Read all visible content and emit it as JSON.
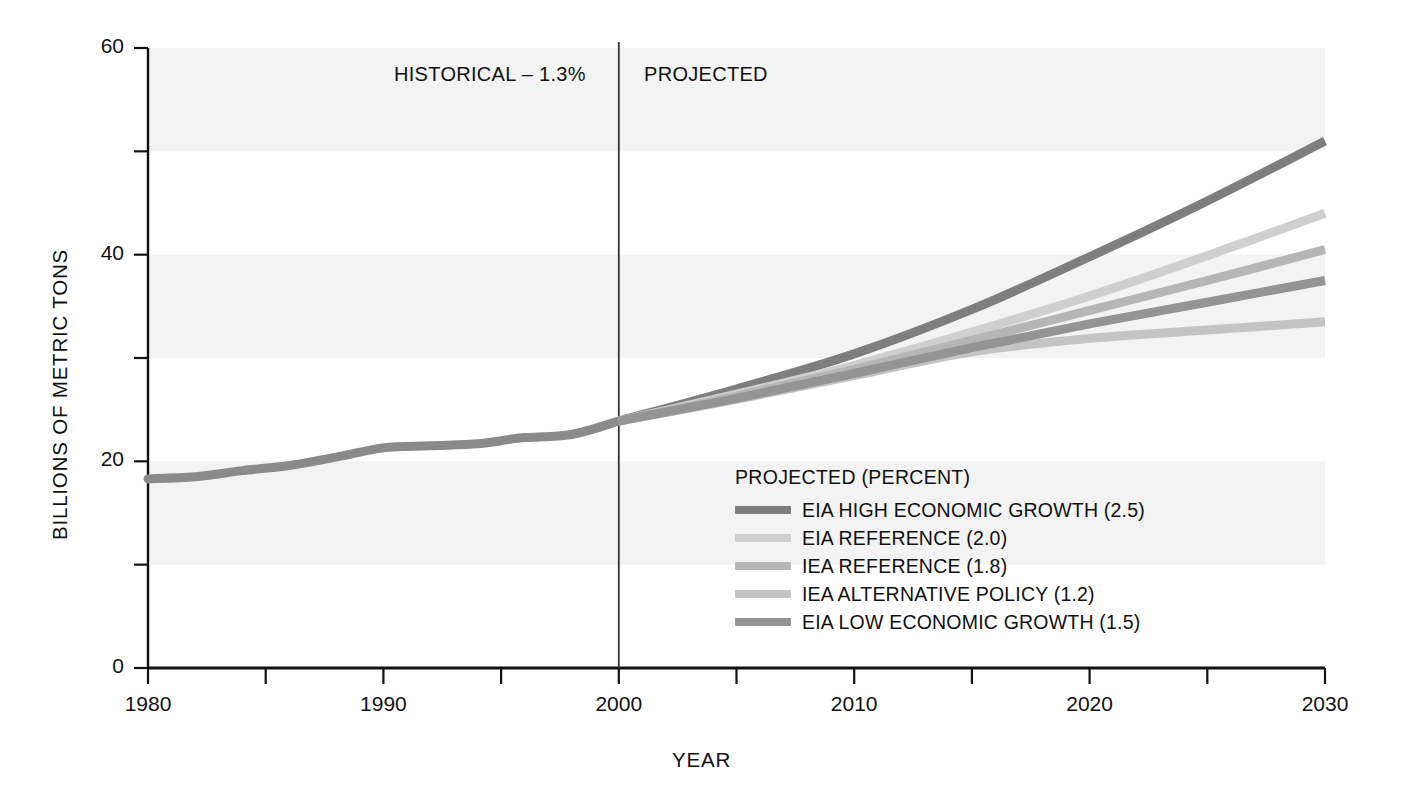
{
  "chart_data": {
    "type": "line",
    "title": "",
    "xlabel": "YEAR",
    "ylabel": "BILLIONS OF METRIC TONS",
    "xlim": [
      1980,
      2030
    ],
    "ylim": [
      0,
      60
    ],
    "ytick_labels": [
      "0",
      "20",
      "40",
      "60"
    ],
    "yticks": [
      0,
      20,
      40,
      60
    ],
    "yminor_ticks": [
      10,
      30,
      50
    ],
    "xtick_labels": [
      "1980",
      "1990",
      "2000",
      "2010",
      "2020",
      "2030"
    ],
    "xticks": [
      1980,
      1990,
      2000,
      2010,
      2020,
      2030
    ],
    "xminor_ticks": [
      1985,
      1995,
      2005,
      2015,
      2025
    ],
    "grid": false,
    "legend_position": "inside-lower-right",
    "divider_year": 2000,
    "annotations": {
      "historical": "HISTORICAL – 1.3%",
      "projected": "PROJECTED"
    },
    "legend_title": "PROJECTED (PERCENT)",
    "historical": {
      "name": "HISTORICAL",
      "color": "#8a8a8a",
      "x": [
        1980,
        1982,
        1984,
        1986,
        1988,
        1990,
        1992,
        1994,
        1995,
        1996,
        1998,
        2000
      ],
      "values": [
        18.3,
        18.5,
        19.1,
        19.6,
        20.4,
        21.3,
        21.5,
        21.7,
        22.0,
        22.3,
        22.6,
        23.9
      ]
    },
    "series": [
      {
        "name": "EIA HIGH ECONOMIC GROWTH (2.5)",
        "percent": 2.5,
        "color": "#7e7e7e",
        "x": [
          2000,
          2005,
          2010,
          2015,
          2020,
          2025,
          2030
        ],
        "values": [
          23.9,
          27.0,
          30.4,
          34.7,
          39.8,
          45.2,
          51.0
        ]
      },
      {
        "name": "EIA REFERENCE (2.0)",
        "percent": 2.0,
        "color": "#cfcfcf",
        "x": [
          2000,
          2005,
          2010,
          2015,
          2020,
          2025,
          2030
        ],
        "values": [
          23.9,
          26.5,
          29.3,
          32.5,
          36.0,
          39.9,
          44.0
        ]
      },
      {
        "name": "IEA REFERENCE (1.8)",
        "percent": 1.8,
        "color": "#b6b6b6",
        "x": [
          2000,
          2005,
          2010,
          2015,
          2020,
          2025,
          2030
        ],
        "values": [
          23.9,
          26.3,
          28.9,
          31.7,
          34.6,
          37.5,
          40.5
        ]
      },
      {
        "name": "IEA ALTERNATIVE POLICY (1.2)",
        "percent": 1.2,
        "color": "#c4c4c4",
        "x": [
          2000,
          2005,
          2010,
          2015,
          2020,
          2025,
          2030
        ],
        "values": [
          23.9,
          26.0,
          28.3,
          30.6,
          31.9,
          32.7,
          33.5
        ]
      },
      {
        "name": "EIA LOW ECONOMIC GROWTH (1.5)",
        "percent": 1.5,
        "color": "#949494",
        "x": [
          2000,
          2005,
          2010,
          2015,
          2020,
          2025,
          2030
        ],
        "values": [
          23.9,
          26.1,
          28.5,
          31.0,
          33.3,
          35.4,
          37.5
        ]
      }
    ],
    "background_bands": [
      {
        "from": 50,
        "to": 60
      },
      {
        "from": 30,
        "to": 40
      },
      {
        "from": 10,
        "to": 20
      }
    ],
    "band_color": "#f3f3f3",
    "axis_color": "#111111"
  }
}
